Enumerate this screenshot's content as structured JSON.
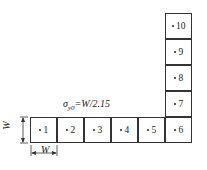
{
  "diagram": {
    "annotation": "σy0=W/2.15",
    "annotation_parts": {
      "symbol": "σ",
      "subscript": "y0",
      "rest": "=W/2.15"
    },
    "dimension_label_vertical": "W",
    "dimension_label_horizontal": "W",
    "cells": [
      {
        "id": "1",
        "label": "1"
      },
      {
        "id": "2",
        "label": "2"
      },
      {
        "id": "3",
        "label": "3"
      },
      {
        "id": "4",
        "label": "4"
      },
      {
        "id": "5",
        "label": "5"
      },
      {
        "id": "6",
        "label": "6"
      },
      {
        "id": "7",
        "label": "7"
      },
      {
        "id": "8",
        "label": "8"
      },
      {
        "id": "9",
        "label": "9"
      },
      {
        "id": "10",
        "label": "10"
      }
    ],
    "colors": {
      "line": "#333333",
      "background": "#ffffff"
    }
  }
}
